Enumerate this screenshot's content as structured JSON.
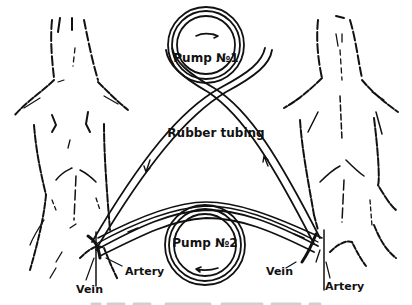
{
  "diagram": {
    "labels": {
      "pump1": "Pump №1",
      "pump2": "Pump №2",
      "tubing": "Rubber tubing",
      "left_vein": "Vein",
      "left_artery": "Artery",
      "right_vein": "Vein",
      "right_artery": "Artery"
    },
    "components": [
      {
        "id": "animal-left",
        "type": "animal-body-outline"
      },
      {
        "id": "animal-right",
        "type": "animal-body-outline"
      },
      {
        "id": "pump-1",
        "type": "pump",
        "position": "top-center",
        "flow_arrow": "clockwise"
      },
      {
        "id": "pump-2",
        "type": "pump",
        "position": "bottom-center",
        "flow_arrow": "counter-clockwise"
      },
      {
        "id": "tubing-upper",
        "type": "rubber-tube",
        "connects": [
          "animal-left",
          "pump-1",
          "animal-right"
        ]
      },
      {
        "id": "tubing-lower",
        "type": "rubber-tube",
        "connects": [
          "animal-left",
          "pump-2",
          "animal-right"
        ]
      }
    ],
    "caption_visible": false
  },
  "colors": {
    "ink": "#111111",
    "paper": "#ffffff"
  }
}
